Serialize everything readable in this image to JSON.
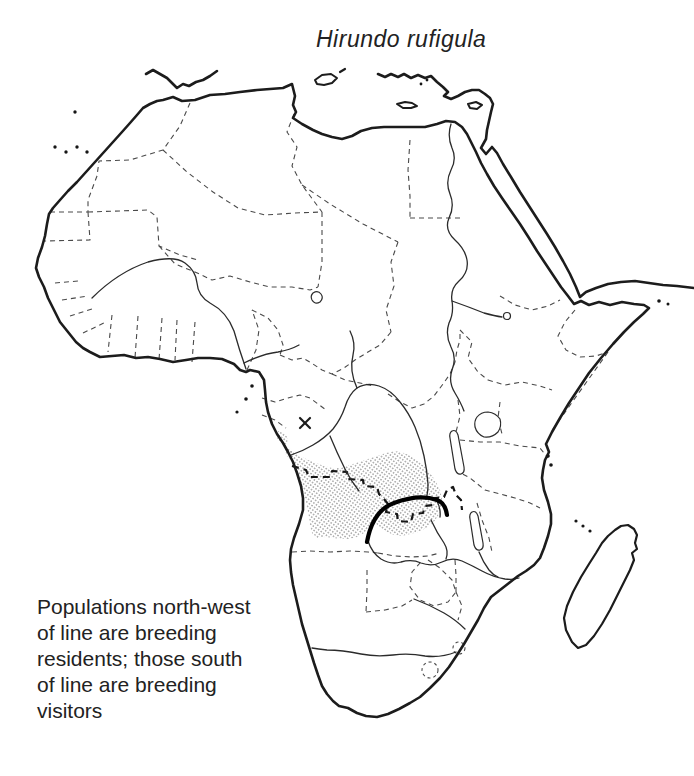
{
  "title": "Hirundo rufigula",
  "caption": {
    "lines": [
      "Populations north-west",
      "of line are breeding",
      "residents; those south",
      "of line are breeding",
      "visitors"
    ],
    "text": "Populations north-west of line are breeding residents; those south of line are breeding visitors"
  },
  "map": {
    "region": "Africa",
    "colors": {
      "background": "#ffffff",
      "coastline": "#1c1c1c",
      "country_borders": "#4a4a4a",
      "range_stipple": "#9e9e9e",
      "divide_line": "#000000"
    }
  }
}
